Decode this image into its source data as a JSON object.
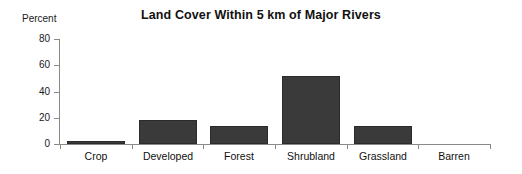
{
  "chart_data": {
    "type": "bar",
    "title": "Land Cover Within 5 km of Major Rivers",
    "xlabel": "",
    "ylabel": "Percent",
    "categories": [
      "Crop",
      "Developed",
      "Forest",
      "Shrubland",
      "Grassland",
      "Barren"
    ],
    "values": [
      2,
      18,
      14,
      52,
      13.5,
      0
    ],
    "ylim": [
      0,
      80
    ],
    "yticks": [
      0,
      20,
      40,
      60,
      80
    ],
    "ytick_labels": [
      "0",
      "20",
      "40",
      "60",
      "80"
    ],
    "grid": false,
    "legend": null,
    "series": [
      {
        "name": "Percent",
        "values": [
          2,
          18,
          14,
          52,
          13.5,
          0
        ]
      }
    ],
    "colors": {
      "bar_fill": "#3a3a3a",
      "bar_stroke": "#2b2b2b",
      "axis": "#8a8a8a",
      "text": "#111111",
      "background": "#ffffff"
    }
  }
}
